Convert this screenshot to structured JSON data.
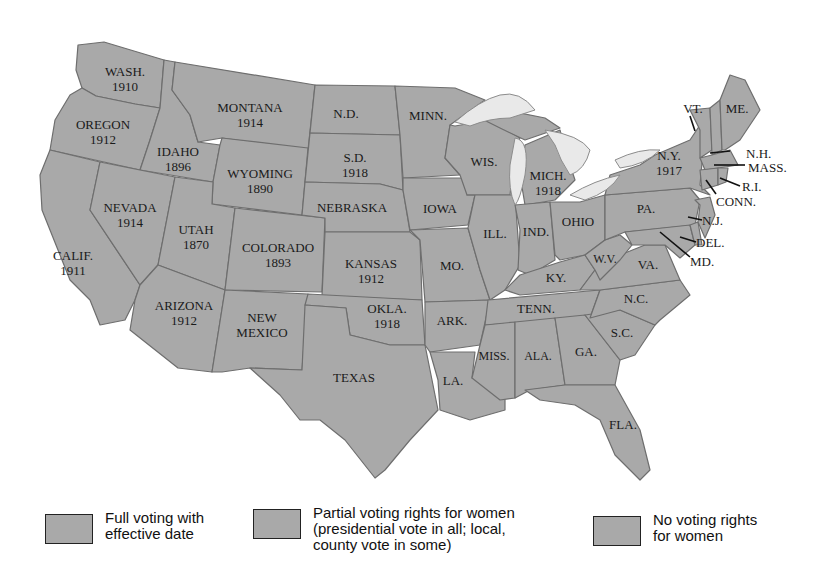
{
  "map": {
    "title": "Woman suffrage before the Nineteenth Amendment",
    "fill_color": "#a9a9a9",
    "border_color": "#6e6e6e",
    "lake_color": "#e9e9e9",
    "states": [
      {
        "abbr": "WASH.",
        "year": "1910"
      },
      {
        "abbr": "OREGON",
        "year": "1912"
      },
      {
        "abbr": "CALIF.",
        "year": "1911"
      },
      {
        "abbr": "IDAHO",
        "year": "1896"
      },
      {
        "abbr": "NEVADA",
        "year": "1914"
      },
      {
        "abbr": "MONTANA",
        "year": "1914"
      },
      {
        "abbr": "WYOMING",
        "year": "1890"
      },
      {
        "abbr": "UTAH",
        "year": "1870"
      },
      {
        "abbr": "COLORADO",
        "year": "1893"
      },
      {
        "abbr": "ARIZONA",
        "year": "1912"
      },
      {
        "abbr": "NEW MEXICO",
        "year": ""
      },
      {
        "abbr": "N.D.",
        "year": ""
      },
      {
        "abbr": "S.D.",
        "year": "1918"
      },
      {
        "abbr": "NEBRASKA",
        "year": ""
      },
      {
        "abbr": "KANSAS",
        "year": "1912"
      },
      {
        "abbr": "OKLA.",
        "year": "1918"
      },
      {
        "abbr": "TEXAS",
        "year": ""
      },
      {
        "abbr": "MINN.",
        "year": ""
      },
      {
        "abbr": "IOWA",
        "year": ""
      },
      {
        "abbr": "MO.",
        "year": ""
      },
      {
        "abbr": "ARK.",
        "year": ""
      },
      {
        "abbr": "LA.",
        "year": ""
      },
      {
        "abbr": "WIS.",
        "year": ""
      },
      {
        "abbr": "ILL.",
        "year": ""
      },
      {
        "abbr": "MICH.",
        "year": "1918"
      },
      {
        "abbr": "IND.",
        "year": ""
      },
      {
        "abbr": "OHIO",
        "year": ""
      },
      {
        "abbr": "KY.",
        "year": ""
      },
      {
        "abbr": "TENN.",
        "year": ""
      },
      {
        "abbr": "MISS.",
        "year": ""
      },
      {
        "abbr": "ALA.",
        "year": ""
      },
      {
        "abbr": "GA.",
        "year": ""
      },
      {
        "abbr": "FLA.",
        "year": ""
      },
      {
        "abbr": "S.C.",
        "year": ""
      },
      {
        "abbr": "N.C.",
        "year": ""
      },
      {
        "abbr": "VA.",
        "year": ""
      },
      {
        "abbr": "W.V.",
        "year": ""
      },
      {
        "abbr": "PA.",
        "year": ""
      },
      {
        "abbr": "N.Y.",
        "year": "1917"
      },
      {
        "abbr": "VT.",
        "year": ""
      },
      {
        "abbr": "ME.",
        "year": ""
      },
      {
        "abbr": "N.H.",
        "year": ""
      },
      {
        "abbr": "MASS.",
        "year": ""
      },
      {
        "abbr": "R.I.",
        "year": ""
      },
      {
        "abbr": "CONN.",
        "year": ""
      },
      {
        "abbr": "N.J.",
        "year": ""
      },
      {
        "abbr": "DEL.",
        "year": ""
      },
      {
        "abbr": "MD.",
        "year": ""
      }
    ]
  },
  "legend": {
    "items": [
      {
        "label": "Full voting with\neffective date",
        "swatch_color": "#a9a9a9"
      },
      {
        "label": "Partial voting rights for women\n(presidential vote in all; local,\ncounty vote in some)",
        "swatch_color": "#a9a9a9"
      },
      {
        "label": "No voting rights\nfor women",
        "swatch_color": "#a9a9a9"
      }
    ]
  }
}
